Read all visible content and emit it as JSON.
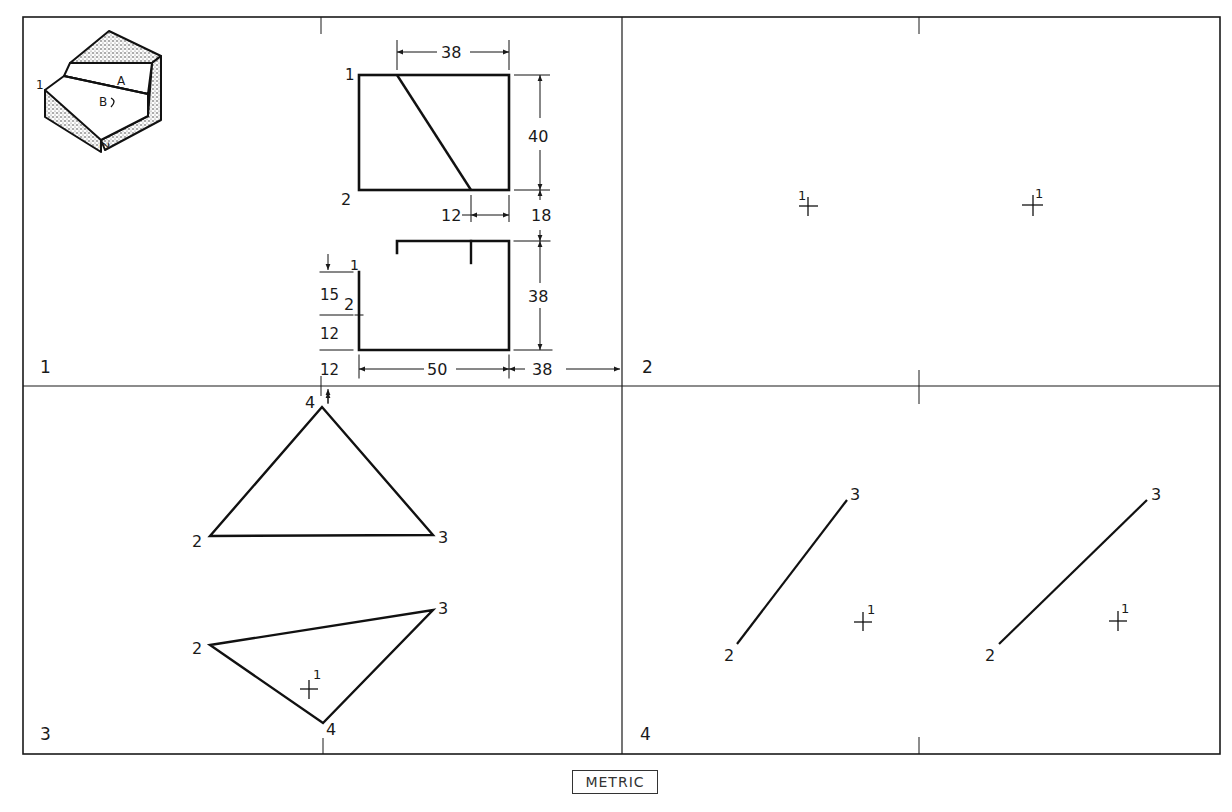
{
  "sheet": {
    "units_label": "METRIC",
    "line_color": "#1a1a1a",
    "stipple_color": "#555555"
  },
  "panels": [
    {
      "number": "1",
      "pictorial": {
        "point_label": "1",
        "surface_a": "A",
        "surface_b": "B",
        "point_label_2": "2"
      },
      "top_view": {
        "corner_labels": [
          "1",
          "2"
        ],
        "dims": {
          "top_width": "38",
          "height": "40",
          "offset_bottom": "12",
          "gap": "18"
        }
      },
      "front_view": {
        "point_labels": [
          "1",
          "2"
        ],
        "dims": {
          "height": "38",
          "width": "50",
          "right_offset": "38",
          "left_15": "15",
          "left_12a": "12",
          "left_12b": "12"
        }
      }
    },
    {
      "number": "2",
      "points": [
        {
          "label": "1"
        },
        {
          "label": "1"
        }
      ]
    },
    {
      "number": "3",
      "upper_triangle": [
        "4",
        "2",
        "3"
      ],
      "lower_triangle": [
        "2",
        "3",
        "4"
      ],
      "point": "1"
    },
    {
      "number": "4",
      "left_line": [
        "2",
        "3"
      ],
      "right_line": [
        "2",
        "3"
      ],
      "points": [
        "1",
        "1"
      ]
    }
  ]
}
